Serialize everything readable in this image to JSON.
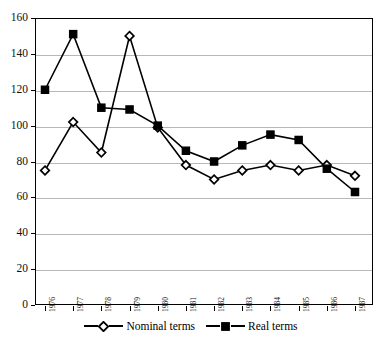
{
  "chart_data": {
    "type": "line",
    "title": "",
    "xlabel": "",
    "ylabel": "",
    "ylim": [
      0,
      160
    ],
    "ytick_step": 20,
    "yticks": [
      0,
      20,
      40,
      60,
      80,
      100,
      120,
      140,
      160
    ],
    "grid": true,
    "legend_position": "bottom",
    "categories": [
      "1976",
      "1977",
      "1978",
      "1979",
      "1980",
      "1981",
      "1982",
      "1983",
      "1984",
      "1985",
      "1986",
      "1987"
    ],
    "series": [
      {
        "name": "Nominal terms",
        "marker": "open-diamond",
        "color": "#000000",
        "values": [
          75,
          102,
          85,
          150,
          99,
          78,
          70,
          75,
          78,
          75,
          78,
          72
        ]
      },
      {
        "name": "Real terms",
        "marker": "filled-square",
        "color": "#000000",
        "values": [
          120,
          151,
          110,
          109,
          100,
          86,
          80,
          89,
          95,
          92,
          76,
          63
        ]
      }
    ]
  },
  "legend": {
    "entries": [
      {
        "label": "Nominal terms",
        "marker": "open-diamond"
      },
      {
        "label": "Real terms",
        "marker": "filled-square"
      }
    ]
  },
  "axes": {
    "y_tick_labels": [
      "160",
      "140",
      "120",
      "100",
      "80",
      "60",
      "40",
      "20",
      "0"
    ],
    "x_tick_labels": [
      "1976",
      "1977",
      "1978",
      "1979",
      "1980",
      "1981",
      "1982",
      "1983",
      "1984",
      "1985",
      "1986",
      "1987"
    ]
  }
}
